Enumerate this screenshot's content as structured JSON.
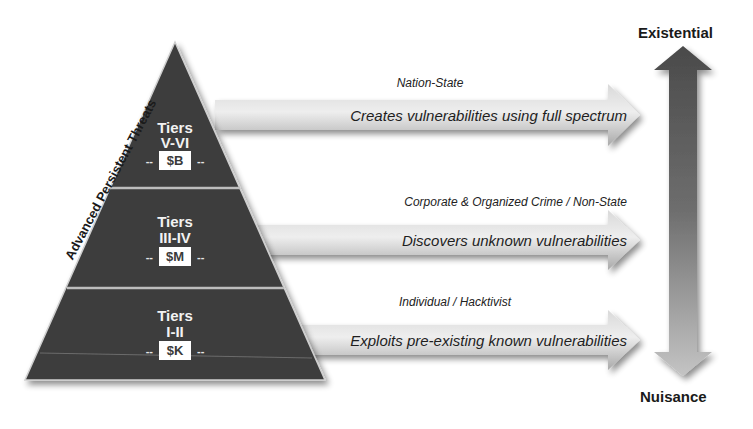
{
  "pyramid": {
    "side_label": "Advanced Persistent Threats",
    "tiers": [
      {
        "title": "Tiers",
        "range": "V-VI",
        "cost": "$B",
        "dash_left": "--",
        "dash_right": "--"
      },
      {
        "title": "Tiers",
        "range": "III-IV",
        "cost": "$M",
        "dash_left": "--",
        "dash_right": "--"
      },
      {
        "title": "Tiers",
        "range": "I-II",
        "cost": "$K",
        "dash_left": "--",
        "dash_right": "--"
      }
    ]
  },
  "arrows": [
    {
      "actor": "Nation-State",
      "description": "Creates vulnerabilities using full spectrum"
    },
    {
      "actor": "Corporate & Organized Crime / Non-State",
      "description": "Discovers unknown vulnerabilities"
    },
    {
      "actor": "Individual / Hacktivist",
      "description": "Exploits pre-existing known vulnerabilities"
    }
  ],
  "scale": {
    "top_label": "Existential",
    "bottom_label": "Nuisance"
  },
  "colors": {
    "pyramid_fill": "#3d3d3d",
    "divider": "#bdbdbd",
    "arrow_light": "#e8e8e8",
    "arrow_dark": "#b0b0b0",
    "scale_dark": "#555555",
    "scale_light": "#b8b8b8"
  }
}
